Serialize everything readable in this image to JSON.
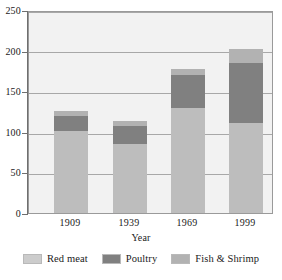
{
  "chart_data": {
    "type": "bar",
    "subtype": "stacked",
    "title": "",
    "xlabel": "Year",
    "ylabel": "",
    "categories": [
      "1909",
      "1939",
      "1969",
      "1999"
    ],
    "series": [
      {
        "name": "Red meat",
        "color": "#bdbdbd",
        "values": [
          101,
          85,
          129,
          111
        ]
      },
      {
        "name": "Poultry",
        "color": "#808080",
        "values": [
          19,
          22,
          41,
          74
        ]
      },
      {
        "name": "Fish & Shrimp",
        "color": "#b2b2b2",
        "values": [
          6,
          6,
          7,
          17
        ]
      }
    ],
    "totals": [
      126,
      113,
      177,
      202
    ],
    "ylim": [
      0,
      250
    ],
    "yticks": [
      0,
      50,
      100,
      150,
      200,
      250
    ],
    "ytick_labels": [
      "0",
      "50",
      "100",
      "150",
      "200",
      "250"
    ],
    "grid": true,
    "legend_position": "bottom",
    "plot_background": "#f2f2f2",
    "gridline_color": "#a8a8a8",
    "axis_color": "#6f6f6f"
  },
  "legend": {
    "items": [
      {
        "label": "Red meat"
      },
      {
        "label": "Poultry"
      },
      {
        "label": "Fish & Shrimp"
      }
    ]
  },
  "axes": {
    "x_title": "Year"
  }
}
